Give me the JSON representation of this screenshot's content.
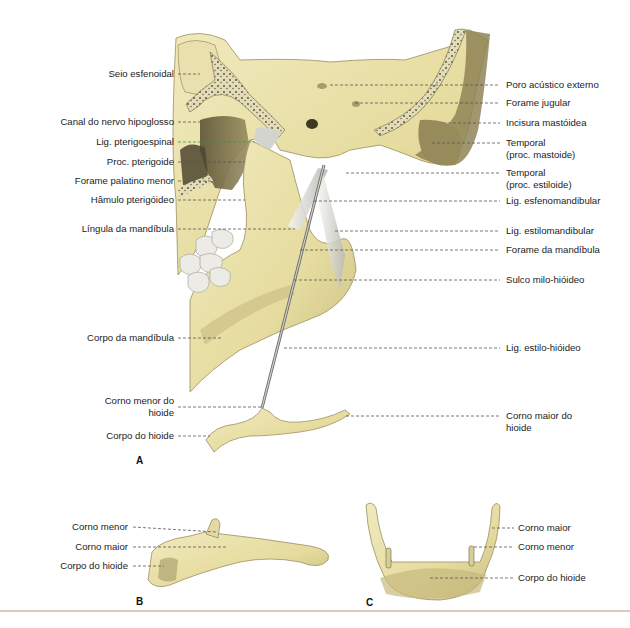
{
  "figure": {
    "colors": {
      "bone": "#e8dfa5",
      "bone_light": "#f1ebc4",
      "bone_shadow": "#8c8055",
      "bone_dark": "#4e4630",
      "ligament": "#d9d9d3",
      "tooth": "#e9e9e6",
      "leader": "#555555",
      "leader_green": "#3a9a3a",
      "divider": "#e2c7b8"
    },
    "panels": {
      "a": {
        "letter": "A",
        "left_labels": [
          {
            "text": "Seio esfenoidal"
          },
          {
            "text": "Canal do nervo hipoglosso"
          },
          {
            "text": "Lig. pterigoespinal"
          },
          {
            "text": "Proc. pterigoide"
          },
          {
            "text": "Forame palatino menor"
          },
          {
            "text": "Hâmulo pterigóideo"
          },
          {
            "text": "Língula da mandíbula"
          },
          {
            "text": "Corpo da mandíbula"
          },
          {
            "text": "Corno menor do",
            "text2": "hioide"
          },
          {
            "text": "Corpo do hioide"
          }
        ],
        "right_labels": [
          {
            "text": "Poro acústico externo"
          },
          {
            "text": "Forame jugular"
          },
          {
            "text": "Incisura mastóidea"
          },
          {
            "text": "Temporal",
            "text2": "(proc. mastoide)"
          },
          {
            "text": "Temporal",
            "text2": "(proc. estiloide)"
          },
          {
            "text": "Lig. esfenomandibular"
          },
          {
            "text": "Lig. estilomandibular"
          },
          {
            "text": "Forame da mandíbula"
          },
          {
            "text": "Sulco milo-hióideo"
          },
          {
            "text": "Lig. estilo-hióideo"
          },
          {
            "text": "Corno maior do",
            "text2": "hioide"
          }
        ]
      },
      "b": {
        "letter": "B",
        "labels": [
          {
            "text": "Corno menor"
          },
          {
            "text": "Corno maior"
          },
          {
            "text": "Corpo do hioide"
          }
        ]
      },
      "c": {
        "letter": "C",
        "labels": [
          {
            "text": "Corno maior"
          },
          {
            "text": "Corno menor"
          },
          {
            "text": "Corpo do hioide"
          }
        ]
      }
    }
  }
}
